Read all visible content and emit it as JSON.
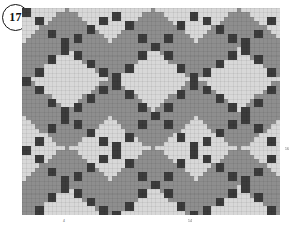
{
  "figure": {
    "badge_label": "17",
    "background": "#ffffff"
  },
  "axes": {
    "x_ticks": [
      "4",
      "14"
    ],
    "y_ticks": [
      "16"
    ]
  },
  "chart_data": {
    "type": "heatmap",
    "title": "",
    "subtitle": "",
    "xlabel": "",
    "ylabel": "",
    "grid": true,
    "legend": null,
    "cell_size_px": 4.3,
    "cols": 60,
    "rows": 48,
    "levels": [
      {
        "name": "base",
        "value": 0,
        "color": "#8e8e8e"
      },
      {
        "name": "light",
        "value": 1,
        "color": "#d8d8d8"
      },
      {
        "name": "dark",
        "value": 2,
        "color": "#3c3c3c"
      }
    ],
    "pattern": {
      "motif": "argyle",
      "diamond_period_cols": 20,
      "diamond_period_rows": 16,
      "diamond_half_width_cols": 9,
      "diamond_half_height_rows": 7,
      "lattice_line_spacing": 20,
      "lattice_marker_step": 3,
      "lattice_marker_size_cells": 1
    },
    "axis_ranges": {
      "x": [
        0,
        60
      ],
      "y": [
        0,
        48
      ]
    },
    "x_tick_positions": [
      4,
      14
    ],
    "y_tick_positions": [
      16
    ]
  }
}
